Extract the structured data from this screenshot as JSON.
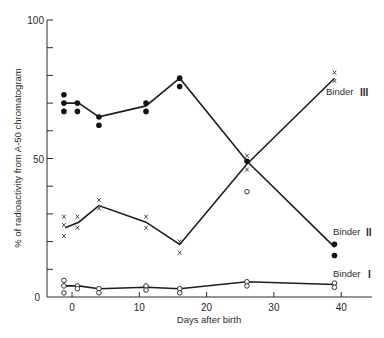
{
  "chart_data": {
    "type": "line",
    "title": "",
    "xlabel": "Days after birth",
    "ylabel": "% of radioactivity from A-50 chromatogram",
    "xlim": [
      -4,
      44
    ],
    "ylim": [
      0,
      100
    ],
    "x_ticks": [
      0,
      10,
      20,
      30,
      40
    ],
    "y_ticks": [
      0,
      50,
      100
    ],
    "y_tick_labels": [
      "0",
      "50",
      "100"
    ],
    "x_tick_labels": [
      "0",
      "10",
      "20",
      "30",
      "40"
    ],
    "grid": false,
    "legend": "inline labels at right end of each curve",
    "series": [
      {
        "name": "Binder III",
        "marker": "x",
        "line": {
          "x": [
            -1,
            1,
            4,
            11,
            16,
            26,
            39
          ],
          "y": [
            25,
            27,
            33,
            27,
            19,
            48,
            79
          ]
        },
        "points": [
          [
            -1.2,
            29
          ],
          [
            -1.2,
            26
          ],
          [
            -1.2,
            22
          ],
          [
            0.8,
            29
          ],
          [
            0.8,
            25
          ],
          [
            4,
            35
          ],
          [
            4,
            32
          ],
          [
            11,
            29
          ],
          [
            11,
            25
          ],
          [
            16,
            20
          ],
          [
            16,
            16
          ],
          [
            26,
            51
          ],
          [
            26,
            46
          ],
          [
            39,
            81
          ],
          [
            39,
            78
          ]
        ]
      },
      {
        "name": "Binder II",
        "marker": "filled-circle",
        "line": {
          "x": [
            -1,
            1,
            4,
            11,
            16,
            26,
            39
          ],
          "y": [
            70,
            70,
            65,
            69,
            79,
            49,
            18
          ]
        },
        "points": [
          [
            -1.2,
            73
          ],
          [
            -1.2,
            70
          ],
          [
            -1.2,
            67
          ],
          [
            0.8,
            70
          ],
          [
            0.8,
            67
          ],
          [
            4,
            65
          ],
          [
            4,
            62
          ],
          [
            11,
            70
          ],
          [
            11,
            67
          ],
          [
            16,
            79
          ],
          [
            16,
            76
          ],
          [
            26,
            49
          ],
          [
            39,
            19
          ],
          [
            39,
            15
          ]
        ]
      },
      {
        "name": "Binder I",
        "marker": "open-circle",
        "line": {
          "x": [
            -1,
            1,
            4,
            11,
            16,
            26,
            39
          ],
          "y": [
            4,
            4,
            3,
            3.5,
            3,
            5.5,
            4.5
          ]
        },
        "points": [
          [
            -1.2,
            6
          ],
          [
            -1.2,
            4
          ],
          [
            -1.2,
            1.5
          ],
          [
            0.8,
            4
          ],
          [
            0.8,
            3
          ],
          [
            4,
            3
          ],
          [
            4,
            1.5
          ],
          [
            11,
            4
          ],
          [
            11,
            2.5
          ],
          [
            16,
            3
          ],
          [
            16,
            1.5
          ],
          [
            26,
            5.5
          ],
          [
            26,
            4
          ],
          [
            26,
            38
          ],
          [
            39,
            5
          ],
          [
            39,
            3.5
          ]
        ]
      }
    ],
    "annotations": [
      {
        "text": "Binder III",
        "x": 41,
        "y": 73
      },
      {
        "text": "Binder II",
        "x": 40,
        "y": 23
      },
      {
        "text": "Binder I",
        "x": 40,
        "y": 8
      }
    ]
  },
  "labels": {
    "xlabel": "Days after birth",
    "ylabel": "% of radioactivity from A-50 chromatogram",
    "binder_iii_prefix": "Binder",
    "binder_iii_numeral": "III",
    "binder_ii_prefix": "Binder",
    "binder_ii_numeral": "II",
    "binder_i_prefix": "Binder",
    "binder_i_numeral": "I"
  }
}
